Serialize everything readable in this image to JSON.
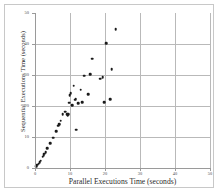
{
  "chart_data": {
    "type": "scatter",
    "title": "",
    "xlabel": "Parallel Executions Time (seconds)",
    "ylabel": "Sequential Executions Time (seconds)",
    "xlim": [
      0,
      50
    ],
    "ylim": [
      0,
      50
    ],
    "xticks": [
      0,
      10,
      20,
      30,
      40,
      50
    ],
    "yticks": [
      0,
      10,
      20,
      30,
      40,
      50
    ],
    "xtick_labels": [
      "0",
      "10",
      "20",
      "30",
      "40",
      "50"
    ],
    "ytick_labels": [
      "0",
      "10",
      "20",
      "30",
      "40",
      "50"
    ],
    "grid": true,
    "legend": null,
    "marker": "filled-circle",
    "marker_color": "#1a1a1a",
    "grid_color": "#b9b9b9",
    "axis_color": "#9a9a9a",
    "background": "#ffffff",
    "points": [
      {
        "x": 0.4,
        "y": 0.5
      },
      {
        "x": 0.7,
        "y": 1.0
      },
      {
        "x": 1.0,
        "y": 1.4
      },
      {
        "x": 1.3,
        "y": 1.9
      },
      {
        "x": 1.6,
        "y": 2.3
      },
      {
        "x": 2.2,
        "y": 3.6
      },
      {
        "x": 2.5,
        "y": 4.2
      },
      {
        "x": 2.7,
        "y": 4.6
      },
      {
        "x": 3.0,
        "y": 5.1
      },
      {
        "x": 3.5,
        "y": 6.4
      },
      {
        "x": 4.3,
        "y": 8.0
      },
      {
        "x": 5.2,
        "y": 9.8
      },
      {
        "x": 6.1,
        "y": 11.8
      },
      {
        "x": 6.6,
        "y": 13.6
      },
      {
        "x": 6.9,
        "y": 14.2
      },
      {
        "x": 7.3,
        "y": 15.2
      },
      {
        "x": 7.9,
        "y": 17.3
      },
      {
        "x": 8.6,
        "y": 18.2
      },
      {
        "x": 9.2,
        "y": 17.3
      },
      {
        "x": 9.4,
        "y": 17.0
      },
      {
        "x": 9.5,
        "y": 17.4
      },
      {
        "x": 9.7,
        "y": 21.0
      },
      {
        "x": 9.9,
        "y": 23.5
      },
      {
        "x": 10.2,
        "y": 24.1
      },
      {
        "x": 10.6,
        "y": 20.2
      },
      {
        "x": 11.0,
        "y": 26.5
      },
      {
        "x": 11.4,
        "y": 22.0
      },
      {
        "x": 11.6,
        "y": 22.2
      },
      {
        "x": 11.8,
        "y": 12.3
      },
      {
        "x": 12.4,
        "y": 20.9
      },
      {
        "x": 13.1,
        "y": 25.2
      },
      {
        "x": 13.5,
        "y": 21.3
      },
      {
        "x": 14.1,
        "y": 29.8
      },
      {
        "x": 15.2,
        "y": 23.8
      },
      {
        "x": 15.8,
        "y": 30.3
      },
      {
        "x": 16.3,
        "y": 35.3
      },
      {
        "x": 18.6,
        "y": 28.8
      },
      {
        "x": 19.3,
        "y": 29.2
      },
      {
        "x": 19.8,
        "y": 21.3
      },
      {
        "x": 20.4,
        "y": 40.3
      },
      {
        "x": 21.5,
        "y": 22.2
      },
      {
        "x": 21.9,
        "y": 31.8
      },
      {
        "x": 23.0,
        "y": 44.7
      }
    ]
  }
}
